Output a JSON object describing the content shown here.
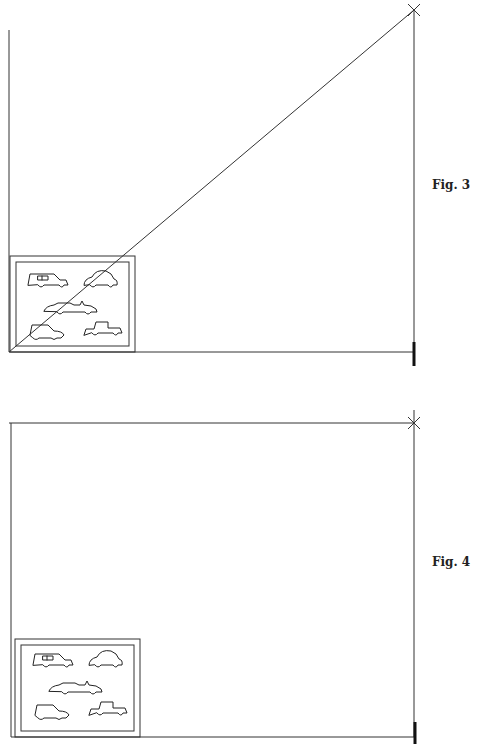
{
  "figures": [
    {
      "id": "fig3",
      "caption": "Fig. 3",
      "description": "Enlargement diagram with diagonal line from frame corner through picture corner to marker",
      "has_diagonal": true,
      "items": [
        "station-wagon",
        "beetle",
        "convertible",
        "sedan",
        "pickup"
      ]
    },
    {
      "id": "fig4",
      "caption": "Fig. 4",
      "description": "Enlargement frame without diagonal",
      "has_diagonal": false,
      "items": [
        "station-wagon",
        "beetle",
        "convertible",
        "sedan",
        "pickup"
      ]
    }
  ]
}
